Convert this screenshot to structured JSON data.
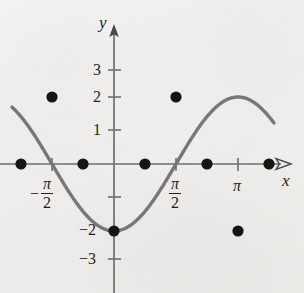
{
  "figure": {
    "kind": "cartesian-graph",
    "background_color": "#f2f1ef",
    "curve_color": "#6a6a6a",
    "axis_color": "#6f6e6c",
    "point_color": "#151515",
    "text_color": "#201f1e"
  },
  "axes": {
    "x_axis_label": "x",
    "y_axis_label": "y",
    "x_tick_labels": [
      {
        "id": "neg-pi-over-2",
        "sign": "−",
        "numerator": "π",
        "denominator": "2",
        "value": -1.5707963
      },
      {
        "id": "pi-over-2",
        "sign": "",
        "numerator": "π",
        "denominator": "2",
        "value": 1.5707963
      },
      {
        "id": "pi",
        "text": "π",
        "value": 3.1415927
      }
    ],
    "y_tick_labels": [
      {
        "text": "3",
        "value": 3
      },
      {
        "text": "2",
        "value": 2
      },
      {
        "text": "1",
        "value": 1
      },
      {
        "text": "−2",
        "value": -2
      },
      {
        "text": "−3",
        "value": -3
      }
    ]
  },
  "chart_data": {
    "type": "line",
    "title": "",
    "xlabel": "x",
    "ylabel": "y",
    "xlim": [
      -2.6179939,
      4.2411501
    ],
    "ylim": [
      -3.9,
      4.0
    ],
    "grid": false,
    "legend": null,
    "function": "y = -2 cos(x)",
    "amplitude": 2,
    "period": 6.2831853,
    "x": [
      -2.3561945,
      -1.5707963,
      -0.7853982,
      0,
      0.7853982,
      1.5707963,
      2.3561945,
      3.1415927,
      3.9269908
    ],
    "y": [
      1.4142136,
      2,
      1.4142136,
      -2,
      1.4142136,
      2,
      1.4142136,
      2,
      1.4142136
    ],
    "marked_points": [
      {
        "label": "",
        "x": -2.3561945,
        "y": 0
      },
      {
        "label": "",
        "x": -1.5707963,
        "y": 2
      },
      {
        "label": "",
        "x": -0.7853982,
        "y": 0
      },
      {
        "label": "",
        "x": 0,
        "y": -2
      },
      {
        "label": "",
        "x": 0.7853982,
        "y": 0
      },
      {
        "label": "",
        "x": 1.5707963,
        "y": 2
      },
      {
        "label": "",
        "x": 2.3561945,
        "y": 0
      },
      {
        "label": "",
        "x": 3.1415927,
        "y": -2
      },
      {
        "label": "",
        "x": 3.9269908,
        "y": 0
      }
    ],
    "x_ticks": [
      -1.5707963,
      1.5707963,
      3.1415927
    ],
    "y_ticks": [
      3,
      2,
      1,
      -1,
      -2,
      -3
    ],
    "y_tick_labels_shown": [
      "3",
      "2",
      "1",
      "−2",
      "−3"
    ]
  }
}
